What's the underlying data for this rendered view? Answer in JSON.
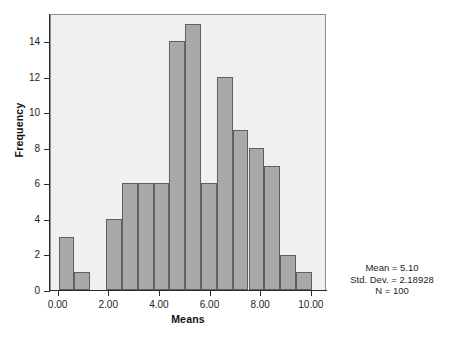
{
  "figure": {
    "background_color": "#ffffff",
    "plot_background_color": "#eef0f2",
    "bar_fill_color": "#a9a9a9",
    "bar_border_color": "#5e6164",
    "axis_color": "#2b2b2b"
  },
  "axes": {
    "x_title": "Means",
    "y_title": "Frequency",
    "x_tick_labels": [
      "0.00",
      "2.00",
      "4.00",
      "6.00",
      "8.00",
      "10.00"
    ],
    "x_tick_values": [
      0,
      2,
      4,
      6,
      8,
      10
    ],
    "y_tick_labels": [
      "0",
      "2",
      "4",
      "6",
      "8",
      "10",
      "12",
      "14"
    ],
    "y_tick_values": [
      0,
      2,
      4,
      6,
      8,
      10,
      12,
      14
    ]
  },
  "stats": {
    "mean_line": "Mean = 5.10",
    "std_dev_line": "Std. Dev. = 2.18928",
    "n_line": "N = 100"
  },
  "caption": {
    "text": ""
  },
  "chart_data": {
    "type": "bar",
    "title": "",
    "subtitle": "",
    "xlabel": "Means",
    "ylabel": "Frequency",
    "xlim": [
      -0.3,
      10.6
    ],
    "ylim": [
      0,
      15.6
    ],
    "grid": false,
    "legend": "none",
    "bin_width": 0.625,
    "categories": [
      "0.31",
      "0.94",
      "1.56",
      "2.19",
      "2.81",
      "3.44",
      "4.06",
      "4.69",
      "5.31",
      "5.94",
      "6.56",
      "7.19",
      "7.81",
      "8.44",
      "9.06",
      "9.69"
    ],
    "bin_starts": [
      0.0,
      0.625,
      1.25,
      1.875,
      2.5,
      3.125,
      3.75,
      4.375,
      5.0,
      5.625,
      6.25,
      6.875,
      7.5,
      8.125,
      8.75,
      9.375
    ],
    "bin_ends": [
      0.625,
      1.25,
      1.875,
      2.5,
      3.125,
      3.75,
      4.375,
      5.0,
      5.625,
      6.25,
      6.875,
      7.5,
      8.125,
      8.75,
      9.375,
      10.0
    ],
    "values": [
      3,
      1,
      0,
      4,
      6,
      6,
      6,
      14,
      15,
      6,
      12,
      9,
      8,
      7,
      2,
      1
    ],
    "annotations": [
      "Mean = 5.10",
      "Std. Dev. = 2.18928",
      "N = 100"
    ]
  }
}
